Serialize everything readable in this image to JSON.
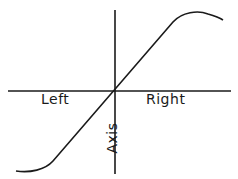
{
  "diagram": {
    "labels": {
      "left": "Left",
      "right": "Right",
      "axis": "Axis"
    },
    "colors": {
      "line": "#1a1a1a",
      "background": "#ffffff"
    }
  }
}
